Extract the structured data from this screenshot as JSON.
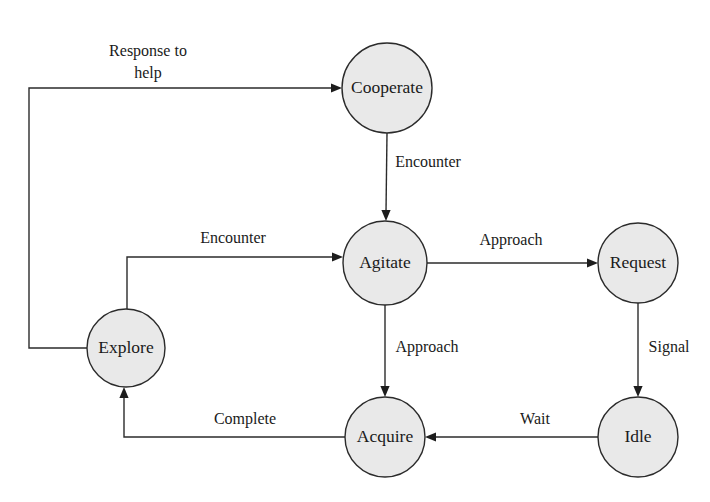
{
  "diagram": {
    "type": "state-transition-diagram",
    "title": "",
    "canvas": {
      "width": 710,
      "height": 502
    },
    "style": {
      "node_fill": "#e9e9e9",
      "node_stroke": "#2b2b2b",
      "edge_stroke": "#2b2b2b",
      "text_color": "#1a1a1a",
      "background": "#ffffff"
    },
    "nodes": [
      {
        "id": "cooperate",
        "label": "Cooperate",
        "cx": 387,
        "cy": 88,
        "r": 45
      },
      {
        "id": "agitate",
        "label": "Agitate",
        "cx": 385,
        "cy": 263,
        "r": 42
      },
      {
        "id": "request",
        "label": "Request",
        "cx": 638,
        "cy": 263,
        "r": 40
      },
      {
        "id": "explore",
        "label": "Explore",
        "cx": 126,
        "cy": 348,
        "r": 39
      },
      {
        "id": "acquire",
        "label": "Acquire",
        "cx": 385,
        "cy": 437,
        "r": 40
      },
      {
        "id": "idle",
        "label": "Idle",
        "cx": 638,
        "cy": 437,
        "r": 40
      }
    ],
    "edges": [
      {
        "id": "explore-to-cooperate",
        "from": "explore",
        "to": "cooperate",
        "label": "Response to help",
        "label_lines": [
          "Response to",
          "help"
        ],
        "label_x": 148,
        "label_y": 52,
        "path": "M 87 348 L 29 348 L 29 88 L 334 88",
        "head_x": 342,
        "head_y": 88,
        "head_dir": "right"
      },
      {
        "id": "cooperate-to-agitate",
        "from": "cooperate",
        "to": "agitate",
        "label": "Encounter",
        "label_lines": [
          "Encounter"
        ],
        "label_x": 428,
        "label_y": 163,
        "path": "M 387 133 L 386 212",
        "head_x": 386,
        "head_y": 221,
        "head_dir": "down"
      },
      {
        "id": "explore-to-agitate",
        "from": "explore",
        "to": "agitate",
        "label": "Encounter",
        "label_lines": [
          "Encounter"
        ],
        "label_x": 233,
        "label_y": 239,
        "path": "M 127 309 L 127 257 L 334 257",
        "head_x": 343,
        "head_y": 257,
        "head_dir": "right"
      },
      {
        "id": "agitate-to-request",
        "from": "agitate",
        "to": "request",
        "label": "Approach",
        "label_lines": [
          "Approach"
        ],
        "label_x": 511,
        "label_y": 241,
        "path": "M 427 263 L 589 263",
        "head_x": 598,
        "head_y": 263,
        "head_dir": "right"
      },
      {
        "id": "agitate-to-acquire",
        "from": "agitate",
        "to": "acquire",
        "label": "Approach",
        "label_lines": [
          "Approach"
        ],
        "label_x": 427,
        "label_y": 348,
        "path": "M 385 305 L 385 388",
        "head_x": 385,
        "head_y": 397,
        "head_dir": "down"
      },
      {
        "id": "request-to-idle",
        "from": "request",
        "to": "idle",
        "label": "Signal",
        "label_lines": [
          "Signal"
        ],
        "label_x": 669,
        "label_y": 348,
        "path": "M 638 303 L 638 388",
        "head_x": 638,
        "head_y": 397,
        "head_dir": "down"
      },
      {
        "id": "idle-to-acquire",
        "from": "idle",
        "to": "acquire",
        "label": "Wait",
        "label_lines": [
          "Wait"
        ],
        "label_x": 535,
        "label_y": 420,
        "path": "M 598 437 L 434 437",
        "head_x": 425,
        "head_y": 437,
        "head_dir": "left"
      },
      {
        "id": "acquire-to-explore",
        "from": "acquire",
        "to": "explore",
        "label": "Complete",
        "label_lines": [
          "Complete"
        ],
        "label_x": 245,
        "label_y": 420,
        "path": "M 345 437 L 124 437 L 124 396",
        "head_x": 124,
        "head_y": 387,
        "head_dir": "up"
      }
    ]
  }
}
